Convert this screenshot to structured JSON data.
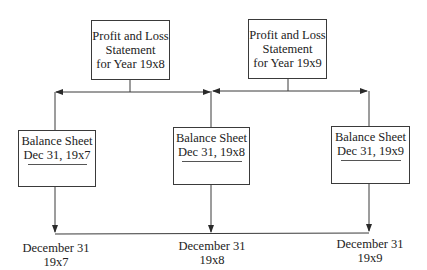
{
  "diagram": {
    "type": "flow",
    "statements": [
      {
        "id": "pl-19x8",
        "lines": [
          "Profit and Loss",
          "Statement",
          "for Year 19x8"
        ]
      },
      {
        "id": "pl-19x9",
        "lines": [
          "Profit and Loss",
          "Statement",
          "for Year 19x9"
        ]
      }
    ],
    "balance_sheets": [
      {
        "id": "bs-19x7",
        "title": "Balance Sheet",
        "date": "Dec 31, 19x7"
      },
      {
        "id": "bs-19x8",
        "title": "Balance Sheet",
        "date": "Dec 31, 19x8"
      },
      {
        "id": "bs-19x9",
        "title": "Balance Sheet",
        "date": "Dec 31, 19x9"
      }
    ],
    "timeline": [
      {
        "month_day": "December 31",
        "year": "19x7"
      },
      {
        "month_day": "December 31",
        "year": "19x8"
      },
      {
        "month_day": "December 31",
        "year": "19x9"
      }
    ],
    "edges": [
      {
        "from": "pl-19x8",
        "to": "bs-19x7"
      },
      {
        "from": "pl-19x8",
        "to": "bs-19x8"
      },
      {
        "from": "pl-19x9",
        "to": "bs-19x8"
      },
      {
        "from": "pl-19x9",
        "to": "bs-19x9"
      },
      {
        "from": "bs-19x7",
        "to": "timeline-19x7"
      },
      {
        "from": "bs-19x8",
        "to": "timeline-19x8"
      },
      {
        "from": "bs-19x9",
        "to": "timeline-19x9"
      }
    ],
    "colors": {
      "line": "#3a3a3a",
      "text": "#222222",
      "background": "#ffffff"
    }
  }
}
